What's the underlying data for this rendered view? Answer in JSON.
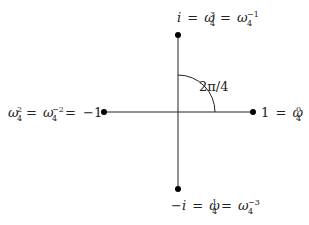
{
  "diagram": {
    "center": {
      "x": 178,
      "y": 112
    },
    "colors": {
      "stroke": "#222222",
      "background": "#ffffff"
    },
    "arc": {
      "radius": 37,
      "label": "2π/4"
    },
    "points": [
      {
        "id": "right",
        "x": 253,
        "y": 112,
        "label": "1 = ω₄⁰",
        "parts": {
          "lhs": "1",
          "w": "ω",
          "sub": "4",
          "sup": "0"
        }
      },
      {
        "id": "top",
        "x": 178,
        "y": 35,
        "label": "i = ω₄³ = ω₄⁻¹",
        "parts": {
          "lhs": "i",
          "w": "ω",
          "sub": "4",
          "sup1": "3",
          "sup2": "−1"
        }
      },
      {
        "id": "left",
        "x": 104,
        "y": 112,
        "label": "ω₄² = ω₄⁻² = −1",
        "parts": {
          "w": "ω",
          "sub": "4",
          "sup1": "2",
          "sup2": "−2",
          "rhs": "−1"
        }
      },
      {
        "id": "bottom",
        "x": 178,
        "y": 189,
        "label": "−i = ω₄¹ = ω₄⁻³",
        "parts": {
          "lhs_minus": "−",
          "lhs": "i",
          "w": "ω",
          "sub": "4",
          "sup1": "1",
          "sup2": "−3"
        }
      }
    ],
    "eq": "="
  }
}
